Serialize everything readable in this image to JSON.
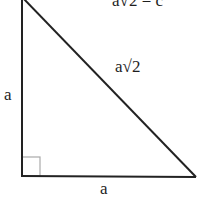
{
  "diagram": {
    "type": "right-triangle",
    "equation": "a√2 = c",
    "labels": {
      "hypotenuse": "a√2",
      "left_leg": "a",
      "bottom_leg": "a"
    },
    "right_angle_marker": true,
    "colors": {
      "stroke": "#222222",
      "right_angle_marker": "#aaaaaa",
      "background": "#ffffff"
    }
  }
}
